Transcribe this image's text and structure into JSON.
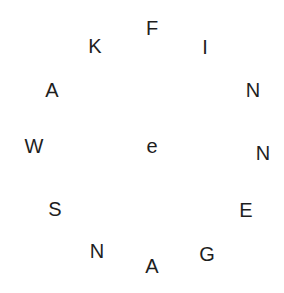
{
  "puzzle": {
    "center_letter": "e",
    "ring_letters": [
      "F",
      "I",
      "N",
      "N",
      "E",
      "G",
      "A",
      "N",
      "S",
      "W",
      "A",
      "K"
    ]
  }
}
